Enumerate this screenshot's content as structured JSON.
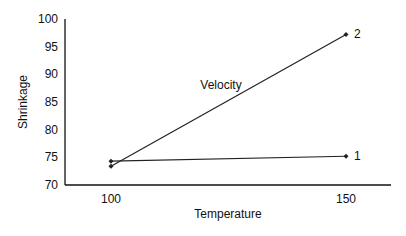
{
  "chart_data": {
    "type": "line",
    "title": "",
    "xlabel": "Temperature",
    "ylabel": "Shrinkage",
    "x": [
      100,
      150
    ],
    "x_ticks": [
      "100",
      "150"
    ],
    "y_ticks": [
      "70",
      "75",
      "80",
      "85",
      "90",
      "95",
      "100"
    ],
    "ylim": [
      70,
      100
    ],
    "xlim": [
      90,
      160
    ],
    "grid": false,
    "legend": "none",
    "annotations": [
      {
        "text": "Velocity",
        "x": 125,
        "y": 88
      }
    ],
    "series": [
      {
        "name": "1",
        "values": [
          74.3,
          75.2
        ]
      },
      {
        "name": "2",
        "values": [
          73.4,
          97.2
        ]
      }
    ]
  },
  "colors": {
    "line": "#222222",
    "axis": "#111111",
    "background": "#ffffff"
  }
}
